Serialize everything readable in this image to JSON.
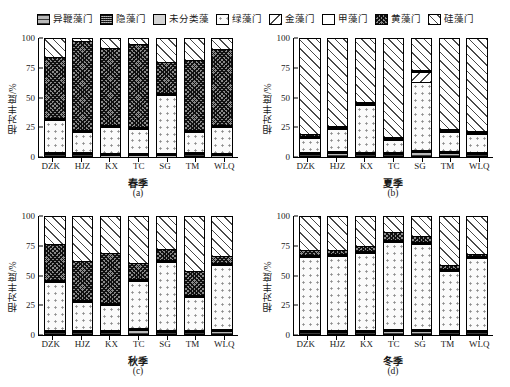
{
  "legend": {
    "items": [
      {
        "label": "异鞭藻门",
        "pattern": "pat-hbar",
        "icon": "legend-swatch-heterokont"
      },
      {
        "label": "隐藻门",
        "pattern": "pat-dense",
        "icon": "legend-swatch-cryptophyta"
      },
      {
        "label": "未分类藻",
        "pattern": "pat-solidgrey",
        "icon": "legend-swatch-unclassified"
      },
      {
        "label": "绿藻门",
        "pattern": "pat-dots",
        "icon": "legend-swatch-chlorophyta"
      },
      {
        "label": "金藻门",
        "pattern": "pat-bdiag",
        "icon": "legend-swatch-chrysophyta"
      },
      {
        "label": "甲藻门",
        "pattern": "pat-white",
        "icon": "legend-swatch-pyrrophyta"
      },
      {
        "label": "黄藻门",
        "pattern": "pat-cross",
        "icon": "legend-swatch-xanthophyta"
      },
      {
        "label": "硅藻门",
        "pattern": "pat-fdiag",
        "icon": "legend-swatch-bacillariophyta"
      }
    ]
  },
  "axis": {
    "ylabel": "相对丰度/%",
    "yticks": [
      "0",
      "25",
      "50",
      "75",
      "100"
    ],
    "ylim": [
      0,
      100
    ]
  },
  "panels": [
    {
      "id": "a",
      "season": "春季",
      "caption": "(a)"
    },
    {
      "id": "b",
      "season": "夏季",
      "caption": "(b)"
    },
    {
      "id": "c",
      "season": "秋季",
      "caption": "(c)"
    },
    {
      "id": "d",
      "season": "冬季",
      "caption": "(d)"
    }
  ],
  "chart_data": [
    {
      "type": "bar",
      "title": "春季",
      "caption": "(a)",
      "stacked": true,
      "xlabel": "",
      "ylabel": "相对丰度/%",
      "ylim": [
        0,
        100
      ],
      "yticks": [
        0,
        25,
        50,
        75,
        100
      ],
      "grid": false,
      "legend_position": "top",
      "categories": [
        "DZK",
        "HJZ",
        "KX",
        "TC",
        "SG",
        "TM",
        "WLQ"
      ],
      "series": [
        {
          "name": "异鞭藻门",
          "values": [
            0.5,
            0.5,
            0.3,
            0.4,
            0.4,
            1.0,
            0.3
          ]
        },
        {
          "name": "隐藻门",
          "values": [
            0.3,
            0.3,
            0.2,
            0.3,
            0.3,
            0.5,
            0.2
          ]
        },
        {
          "name": "未分类藻",
          "values": [
            0.4,
            0.4,
            0.3,
            0.4,
            0.4,
            0.5,
            0.3
          ]
        },
        {
          "name": "绿藻门",
          "values": [
            28.0,
            17.5,
            22.5,
            20.5,
            50.0,
            17.0,
            22.5
          ]
        },
        {
          "name": "金藻门",
          "values": [
            0.4,
            0.3,
            0.3,
            0.4,
            0.4,
            0.5,
            0.3
          ]
        },
        {
          "name": "甲藻门",
          "values": [
            0.3,
            0.3,
            0.3,
            0.3,
            0.3,
            0.3,
            0.3
          ]
        },
        {
          "name": "黄藻门",
          "values": [
            53.5,
            78.2,
            67.6,
            72.2,
            27.7,
            60.7,
            66.8
          ]
        },
        {
          "name": "硅藻门",
          "values": [
            16.6,
            2.5,
            8.5,
            5.5,
            20.5,
            19.5,
            9.3
          ]
        }
      ]
    },
    {
      "type": "bar",
      "title": "夏季",
      "caption": "(b)",
      "stacked": true,
      "xlabel": "",
      "ylabel": "相对丰度/%",
      "ylim": [
        0,
        100
      ],
      "yticks": [
        0,
        25,
        50,
        75,
        100
      ],
      "grid": false,
      "legend_position": "top",
      "categories": [
        "DZK",
        "HJZ",
        "KX",
        "TC",
        "SG",
        "TM",
        "WLQ"
      ],
      "series": [
        {
          "name": "异鞭藻门",
          "values": [
            1.0,
            1.5,
            1.2,
            1.0,
            2.6,
            2.0,
            0.6
          ]
        },
        {
          "name": "隐藻门",
          "values": [
            0.4,
            0.4,
            0.4,
            0.4,
            0.5,
            0.4,
            0.3
          ]
        },
        {
          "name": "未分类藻",
          "values": [
            0.4,
            0.4,
            0.4,
            0.4,
            0.5,
            0.4,
            0.3
          ]
        },
        {
          "name": "绿藻门",
          "values": [
            12.5,
            19.5,
            40.5,
            10.5,
            58.5,
            16.5,
            16.0
          ]
        },
        {
          "name": "金藻门",
          "values": [
            0.4,
            0.4,
            0.4,
            0.4,
            9.0,
            0.4,
            0.3
          ]
        },
        {
          "name": "甲藻门",
          "values": [
            0.3,
            0.3,
            0.3,
            0.3,
            0.3,
            0.3,
            0.3
          ]
        },
        {
          "name": "黄藻门",
          "values": [
            1.0,
            1.0,
            1.0,
            1.0,
            1.0,
            1.0,
            1.0
          ]
        },
        {
          "name": "硅藻门",
          "values": [
            84.0,
            76.5,
            55.8,
            86.0,
            27.6,
            79.0,
            81.2
          ]
        }
      ]
    },
    {
      "type": "bar",
      "title": "秋季",
      "caption": "(c)",
      "stacked": true,
      "xlabel": "",
      "ylabel": "相对丰度/%",
      "ylim": [
        0,
        100
      ],
      "yticks": [
        0,
        25,
        50,
        75,
        100
      ],
      "grid": false,
      "legend_position": "top",
      "categories": [
        "DZK",
        "HJZ",
        "KX",
        "TC",
        "SG",
        "TM",
        "WLQ"
      ],
      "series": [
        {
          "name": "异鞭藻门",
          "values": [
            0.6,
            0.6,
            0.6,
            2.2,
            0.6,
            0.6,
            2.0
          ]
        },
        {
          "name": "隐藻门",
          "values": [
            0.3,
            0.3,
            0.3,
            0.5,
            0.3,
            0.3,
            0.5
          ]
        },
        {
          "name": "未分类藻",
          "values": [
            0.4,
            0.4,
            0.4,
            0.5,
            0.4,
            0.4,
            0.5
          ]
        },
        {
          "name": "绿藻门",
          "values": [
            42.5,
            24.5,
            22.0,
            41.0,
            59.5,
            29.5,
            55.0
          ]
        },
        {
          "name": "金藻门",
          "values": [
            0.4,
            0.4,
            0.4,
            0.4,
            0.4,
            0.4,
            0.4
          ]
        },
        {
          "name": "甲藻门",
          "values": [
            0.3,
            0.3,
            0.3,
            0.3,
            0.3,
            0.3,
            0.3
          ]
        },
        {
          "name": "黄藻门",
          "values": [
            31.5,
            34.5,
            44.0,
            14.1,
            9.5,
            20.5,
            6.3
          ]
        },
        {
          "name": "硅藻门",
          "values": [
            24.0,
            39.0,
            32.0,
            41.0,
            29.0,
            48.0,
            35.0
          ]
        }
      ]
    },
    {
      "type": "bar",
      "title": "冬季",
      "caption": "(d)",
      "stacked": true,
      "xlabel": "",
      "ylabel": "相对丰度/%",
      "ylim": [
        0,
        100
      ],
      "yticks": [
        0,
        25,
        50,
        75,
        100
      ],
      "grid": false,
      "legend_position": "top",
      "categories": [
        "DZK",
        "HJZ",
        "KX",
        "TC",
        "SG",
        "TM",
        "WLQ"
      ],
      "series": [
        {
          "name": "异鞭藻门",
          "values": [
            0.8,
            0.8,
            0.8,
            1.5,
            1.5,
            0.8,
            0.8
          ]
        },
        {
          "name": "隐藻门",
          "values": [
            0.3,
            0.3,
            0.3,
            0.4,
            0.4,
            0.3,
            0.3
          ]
        },
        {
          "name": "未分类藻",
          "values": [
            0.4,
            0.4,
            0.4,
            0.4,
            0.4,
            0.4,
            0.4
          ]
        },
        {
          "name": "绿藻门",
          "values": [
            64.0,
            65.0,
            67.5,
            76.2,
            74.7,
            52.0,
            62.5
          ]
        },
        {
          "name": "金藻门",
          "values": [
            0.4,
            0.4,
            0.4,
            0.4,
            0.4,
            0.4,
            0.4
          ]
        },
        {
          "name": "甲藻门",
          "values": [
            0.3,
            0.3,
            0.3,
            0.3,
            0.3,
            0.3,
            0.3
          ]
        },
        {
          "name": "黄藻门",
          "values": [
            3.8,
            2.8,
            4.3,
            6.8,
            4.7,
            2.8,
            2.3
          ]
        },
        {
          "name": "硅藻门",
          "values": [
            30.0,
            30.0,
            26.0,
            14.0,
            17.6,
            43.0,
            33.0
          ]
        }
      ]
    }
  ]
}
